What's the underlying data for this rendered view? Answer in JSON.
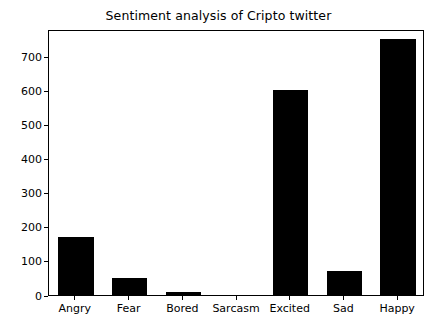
{
  "chart_data": {
    "type": "bar",
    "title": "Sentiment analysis of Cripto twitter",
    "xlabel": "",
    "ylabel": "",
    "categories": [
      "Angry",
      "Fear",
      "Bored",
      "Sarcasm",
      "Excited",
      "Sad",
      "Happy"
    ],
    "values": [
      170,
      50,
      10,
      0,
      600,
      70,
      750
    ],
    "ylim": [
      0,
      780
    ],
    "yticks": [
      0,
      100,
      200,
      300,
      400,
      500,
      600,
      700
    ],
    "ytick_labels": [
      "0",
      "100",
      "200",
      "300",
      "400",
      "500",
      "600",
      "700"
    ],
    "grid": false,
    "legend": null,
    "bar_color": "#000000",
    "background_color": "#ffffff",
    "axes_color": "#000000"
  }
}
